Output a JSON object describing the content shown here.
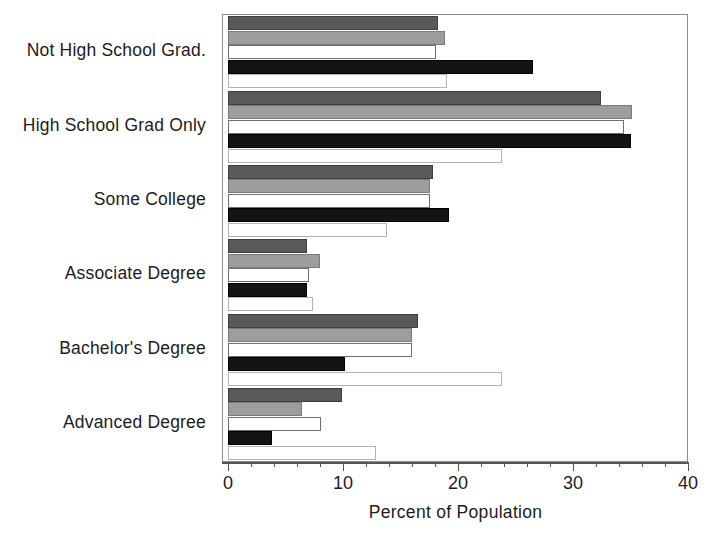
{
  "chart_data": {
    "type": "bar",
    "orientation": "horizontal",
    "title": "",
    "xlabel": "Percent of Population",
    "ylabel": "",
    "xlim": [
      0,
      40
    ],
    "xticks": [
      0,
      10,
      20,
      30,
      40
    ],
    "xtick_labels": [
      "0",
      "10",
      "20",
      "30",
      "40"
    ],
    "minor_tick_step": 2,
    "grid": false,
    "legend": "none",
    "categories": [
      "Not High School Grad.",
      "High School Grad Only",
      "Some College",
      "Associate Degree",
      "Bachelor's Degree",
      "Advanced Degree"
    ],
    "series": [
      {
        "name": "series-1",
        "color": "#595959",
        "values": [
          18.3,
          32.4,
          17.8,
          6.9,
          16.5,
          9.9
        ]
      },
      {
        "name": "series-2",
        "color": "#9d9d9d",
        "values": [
          18.9,
          35.1,
          17.6,
          8.0,
          16.0,
          6.4
        ]
      },
      {
        "name": "series-3",
        "color": "#ffffff",
        "values": [
          18.1,
          34.4,
          17.6,
          7.0,
          16.0,
          8.1
        ]
      },
      {
        "name": "series-4",
        "color": "#141414",
        "values": [
          26.5,
          35.0,
          19.2,
          6.9,
          10.2,
          3.8
        ]
      },
      {
        "name": "series-5",
        "color": "#ffffff",
        "values": [
          19.0,
          23.8,
          13.8,
          7.4,
          23.8,
          12.9
        ]
      }
    ]
  }
}
